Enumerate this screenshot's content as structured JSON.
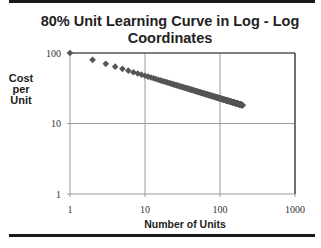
{
  "chart_data": {
    "type": "scatter",
    "title": "80% Unit Learning Curve in Log - Log Coordinates",
    "title_lines": [
      "80% Unit Learning Curve in Log - Log",
      "Coordinates"
    ],
    "xlabel": "Number of Units",
    "ylabel": "Cost per Unit",
    "ylabel_lines": [
      "Cost",
      "per",
      "Unit"
    ],
    "xscale": "log",
    "yscale": "log",
    "xlim": [
      1,
      1000
    ],
    "ylim": [
      1,
      100
    ],
    "xticks": [
      "1",
      "10",
      "100",
      "1000"
    ],
    "yticks": [
      "1",
      "10",
      "100"
    ],
    "grid": true,
    "legend": null,
    "series": [
      {
        "name": "Cost per Unit",
        "marker": "diamond",
        "color": "#555555",
        "learning_rate": 0.8,
        "first_unit_cost": 100,
        "x_range": [
          1,
          200
        ],
        "sample_points": [
          {
            "x": 1,
            "y": 100
          },
          {
            "x": 2,
            "y": 80
          },
          {
            "x": 3,
            "y": 70.2
          },
          {
            "x": 4,
            "y": 64
          },
          {
            "x": 5,
            "y": 59.6
          },
          {
            "x": 10,
            "y": 47.7
          },
          {
            "x": 20,
            "y": 38.1
          },
          {
            "x": 50,
            "y": 28.4
          },
          {
            "x": 100,
            "y": 22.7
          },
          {
            "x": 200,
            "y": 18.2
          }
        ]
      }
    ]
  },
  "colors": {
    "marker": "#555555",
    "grid": "#9a9a9a",
    "axis_frame": "#333333",
    "rule": "#1a1a1a"
  }
}
